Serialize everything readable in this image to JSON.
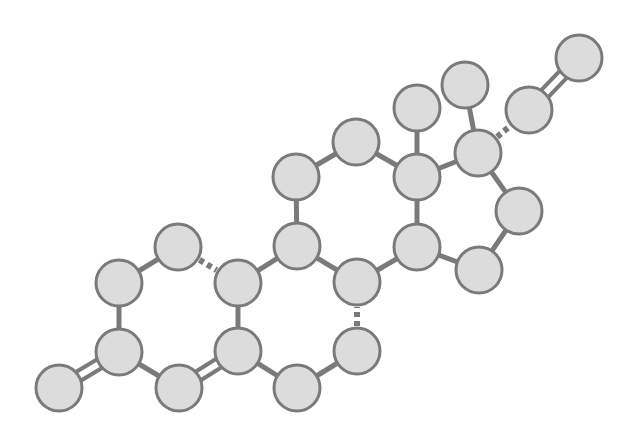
{
  "diagram": {
    "type": "molecular-ball-and-stick",
    "colors": {
      "atom_fill": "#dcdcdc",
      "atom_stroke": "#7a7a7a",
      "bond": "#7a7a7a",
      "background": "#ffffff"
    },
    "atom_radius": 23,
    "atoms": [
      {
        "id": "a1",
        "x": 59,
        "y": 388
      },
      {
        "id": "a2",
        "x": 119,
        "y": 352
      },
      {
        "id": "a3",
        "x": 119,
        "y": 283
      },
      {
        "id": "a4",
        "x": 178,
        "y": 247
      },
      {
        "id": "a5",
        "x": 238,
        "y": 283
      },
      {
        "id": "a6",
        "x": 238,
        "y": 351
      },
      {
        "id": "a7",
        "x": 179,
        "y": 388
      },
      {
        "id": "a8",
        "x": 297,
        "y": 388
      },
      {
        "id": "a9",
        "x": 357,
        "y": 351
      },
      {
        "id": "a10",
        "x": 357,
        "y": 282
      },
      {
        "id": "a11",
        "x": 297,
        "y": 246
      },
      {
        "id": "a12",
        "x": 296,
        "y": 177
      },
      {
        "id": "a13",
        "x": 356,
        "y": 142
      },
      {
        "id": "a14",
        "x": 417,
        "y": 177
      },
      {
        "id": "a15",
        "x": 417,
        "y": 247
      },
      {
        "id": "a16",
        "x": 479,
        "y": 270
      },
      {
        "id": "a17",
        "x": 519,
        "y": 211
      },
      {
        "id": "a18",
        "x": 478,
        "y": 153
      },
      {
        "id": "a19",
        "x": 417,
        "y": 108
      },
      {
        "id": "a20",
        "x": 465,
        "y": 85
      },
      {
        "id": "a21",
        "x": 529,
        "y": 110
      },
      {
        "id": "a22",
        "x": 579,
        "y": 58
      }
    ],
    "bonds": [
      {
        "from": "a1",
        "to": "a2",
        "type": "double"
      },
      {
        "from": "a2",
        "to": "a3",
        "type": "single"
      },
      {
        "from": "a3",
        "to": "a4",
        "type": "single"
      },
      {
        "from": "a4",
        "to": "a5",
        "type": "dashed"
      },
      {
        "from": "a5",
        "to": "a6",
        "type": "single"
      },
      {
        "from": "a6",
        "to": "a7",
        "type": "double"
      },
      {
        "from": "a7",
        "to": "a2",
        "type": "single"
      },
      {
        "from": "a6",
        "to": "a8",
        "type": "single"
      },
      {
        "from": "a8",
        "to": "a9",
        "type": "single"
      },
      {
        "from": "a9",
        "to": "a10",
        "type": "dashed"
      },
      {
        "from": "a10",
        "to": "a11",
        "type": "single"
      },
      {
        "from": "a11",
        "to": "a5",
        "type": "single"
      },
      {
        "from": "a11",
        "to": "a12",
        "type": "single"
      },
      {
        "from": "a12",
        "to": "a13",
        "type": "single"
      },
      {
        "from": "a13",
        "to": "a14",
        "type": "single"
      },
      {
        "from": "a14",
        "to": "a15",
        "type": "single"
      },
      {
        "from": "a15",
        "to": "a10",
        "type": "single"
      },
      {
        "from": "a15",
        "to": "a16",
        "type": "single"
      },
      {
        "from": "a16",
        "to": "a17",
        "type": "single"
      },
      {
        "from": "a17",
        "to": "a18",
        "type": "single"
      },
      {
        "from": "a18",
        "to": "a14",
        "type": "single"
      },
      {
        "from": "a14",
        "to": "a19",
        "type": "single"
      },
      {
        "from": "a18",
        "to": "a20",
        "type": "single"
      },
      {
        "from": "a18",
        "to": "a21",
        "type": "dashed"
      },
      {
        "from": "a21",
        "to": "a22",
        "type": "double"
      }
    ]
  }
}
